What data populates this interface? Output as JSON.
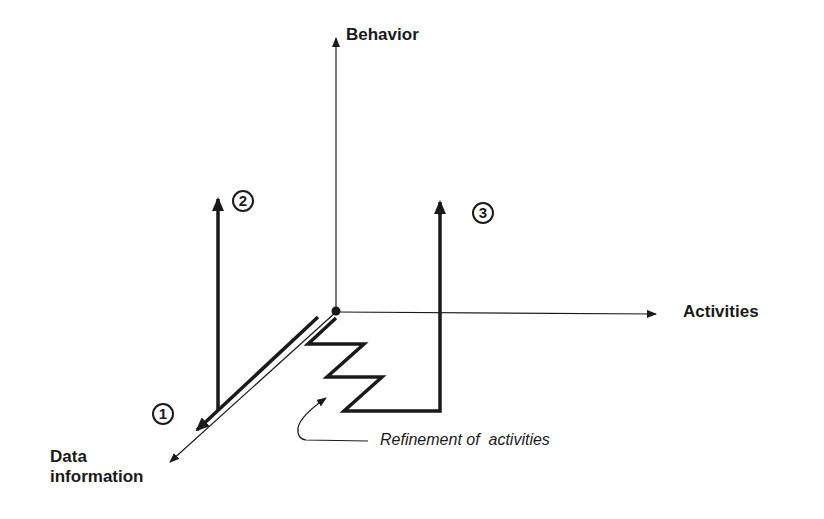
{
  "diagram": {
    "type": "3d-axis-schematic",
    "axes": {
      "vertical": {
        "label": "Behavior"
      },
      "horizontal": {
        "label": "Activities"
      },
      "depth": {
        "label_line1": "Data",
        "label_line2": "information"
      }
    },
    "paths": [
      {
        "id": "1",
        "marker": "1",
        "description": "thick arrow along Data information axis"
      },
      {
        "id": "2",
        "marker": "2",
        "description": "thick arrow along Data axis then up toward Behavior"
      },
      {
        "id": "3",
        "marker": "3",
        "description": "zigzag refinement of activities then up toward Behavior"
      }
    ],
    "annotation": {
      "text": "Refinement of  activities"
    },
    "colors": {
      "ink": "#1a1a1a",
      "background": "#ffffff"
    }
  }
}
